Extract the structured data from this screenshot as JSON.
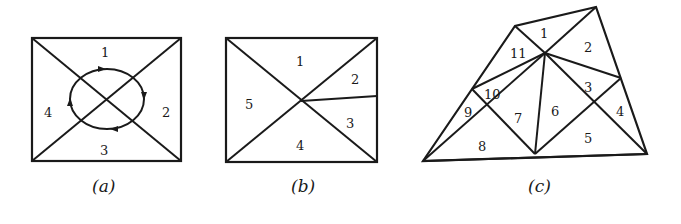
{
  "figure": {
    "panels": [
      {
        "id": "a",
        "caption": "(a)",
        "region_labels": [
          "1",
          "2",
          "3",
          "4"
        ],
        "description": "Rectangle split by both diagonals into 4 triangles; clockwise circular path around the center"
      },
      {
        "id": "b",
        "caption": "(b)",
        "region_labels": [
          "1",
          "2",
          "3",
          "4",
          "5"
        ],
        "description": "Rectangle split by both diagonals, right triangle further split into two by a segment from center"
      },
      {
        "id": "c",
        "caption": "(c)",
        "region_labels": [
          "1",
          "2",
          "3",
          "4",
          "5",
          "6",
          "7",
          "8",
          "9",
          "10",
          "11"
        ],
        "description": "Irregular quadrilateral triangulated into 11 triangles"
      }
    ]
  },
  "colors": {
    "ink": "#1a1a1a",
    "background": "#ffffff"
  }
}
